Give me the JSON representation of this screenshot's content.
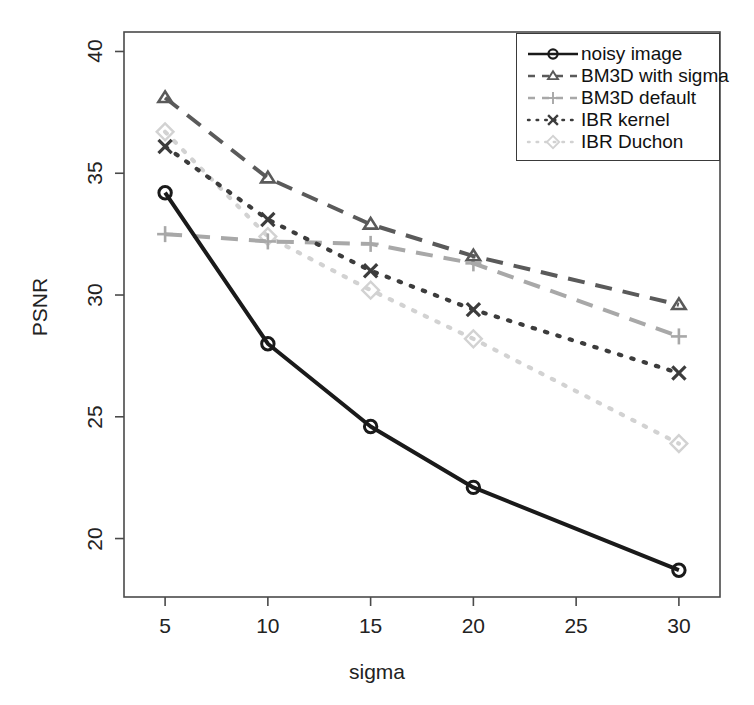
{
  "chart_data": {
    "type": "line",
    "title": "",
    "xlabel": "sigma",
    "ylabel": "PSNR",
    "x": [
      5,
      10,
      15,
      20,
      30
    ],
    "xlim": [
      3,
      32
    ],
    "ylim": [
      17.6,
      40.8
    ],
    "xticks": [
      "5",
      "10",
      "15",
      "20",
      "25",
      "30"
    ],
    "xtick_values": [
      5,
      10,
      15,
      20,
      25,
      30
    ],
    "yticks": [
      "20",
      "25",
      "30",
      "35",
      "40"
    ],
    "ytick_values": [
      20,
      25,
      30,
      35,
      40
    ],
    "grid": false,
    "legend_position": "top-right",
    "series": [
      {
        "name": "noisy image",
        "values": [
          34.2,
          28.0,
          24.6,
          22.1,
          18.7
        ],
        "color": "#1a1a1a",
        "linestyle": "solid",
        "marker": "circle"
      },
      {
        "name": "BM3D with sigma",
        "values": [
          38.1,
          34.8,
          32.9,
          31.6,
          29.6
        ],
        "color": "#5a5a5a",
        "linestyle": "dashed",
        "marker": "triangle"
      },
      {
        "name": "BM3D default",
        "values": [
          32.5,
          32.2,
          32.1,
          31.3,
          28.3
        ],
        "color": "#a8a8a8",
        "linestyle": "dashed",
        "marker": "plus"
      },
      {
        "name": "IBR kernel",
        "values": [
          36.1,
          33.1,
          31.0,
          29.4,
          26.8
        ],
        "color": "#3c3c3c",
        "linestyle": "dotted",
        "marker": "cross"
      },
      {
        "name": "IBR Duchon",
        "values": [
          36.7,
          32.4,
          30.2,
          28.2,
          23.9
        ],
        "color": "#d2d2d2",
        "linestyle": "dotted",
        "marker": "diamond"
      }
    ]
  },
  "legend": {
    "items": [
      {
        "label": "noisy image"
      },
      {
        "label": "BM3D with sigma"
      },
      {
        "label": "BM3D default"
      },
      {
        "label": "IBR kernel"
      },
      {
        "label": "IBR Duchon"
      }
    ]
  }
}
